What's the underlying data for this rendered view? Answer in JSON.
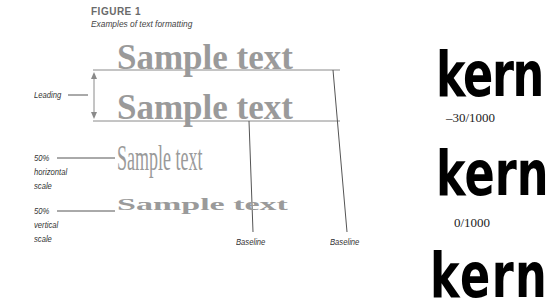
{
  "figure": {
    "number": "FIGURE 1",
    "caption": "Examples of text formatting"
  },
  "samples": {
    "line1": "Sample text",
    "line2": "Sample text",
    "horizontal_scaled": "Sample text",
    "vertical_scaled": "Sample text"
  },
  "labels": {
    "leading": "Leading",
    "horizontal_scale": [
      "50%",
      "horizontal",
      "scale"
    ],
    "vertical_scale": [
      "50%",
      "vertical",
      "scale"
    ],
    "baseline_left": "Baseline",
    "baseline_right": "Baseline"
  },
  "kerning": [
    {
      "word": "kern",
      "value": "–30/1000",
      "letter_spacing_em": -0.03
    },
    {
      "word": "kern",
      "value": "0/1000",
      "letter_spacing_em": 0
    },
    {
      "word": "kern",
      "value": "",
      "letter_spacing_em": 0.03
    }
  ],
  "colors": {
    "sample_text": "#9a9a9a",
    "rule_lines": "#888888",
    "kern_text": "#000000"
  }
}
